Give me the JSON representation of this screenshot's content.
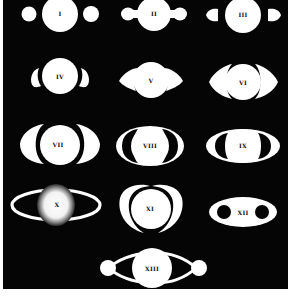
{
  "figure": {
    "background_color": "#050505",
    "figure_color": "#ffffff",
    "label_color": "#111111",
    "items": [
      {
        "label": "I",
        "shape": "globe with two detached round side bodies"
      },
      {
        "label": "II",
        "shape": "globe with attached rounded side lobes"
      },
      {
        "label": "III",
        "shape": "globe with detached teardrop side lobes"
      },
      {
        "label": "IV",
        "shape": "globe with crescent-shaped side arms"
      },
      {
        "label": "V",
        "shape": "globe with pointed crescent ansae"
      },
      {
        "label": "VI",
        "shape": "globe with elongated crescent ansae"
      },
      {
        "label": "VII",
        "shape": "globe with wide crescent ansae"
      },
      {
        "label": "VIII",
        "shape": "globe enclosed by elliptical ring with dark gaps"
      },
      {
        "label": "IX",
        "shape": "globe within flattened elliptical ring"
      },
      {
        "label": "X",
        "shape": "hazy glowing globe with thin elliptical ring"
      },
      {
        "label": "XI",
        "shape": "globe with tall crescent arcs above and below"
      },
      {
        "label": "XII",
        "shape": "white ellipse with two dark round holes"
      },
      {
        "label": "XIII",
        "shape": "globe with two side bodies joined by curved arcs"
      }
    ]
  }
}
